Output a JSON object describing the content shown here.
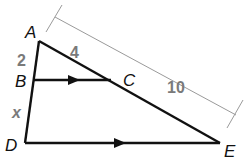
{
  "diagram": {
    "type": "geometry-triangle-parallel-lines",
    "points": {
      "A": {
        "label": "A"
      },
      "B": {
        "label": "B"
      },
      "C": {
        "label": "C"
      },
      "D": {
        "label": "D"
      },
      "E": {
        "label": "E"
      }
    },
    "measurements": {
      "AB": "2",
      "BD": "x",
      "AC": "4",
      "AE": "10"
    },
    "parallel_segments": [
      "BC",
      "DE"
    ],
    "colors": {
      "lines": "#111111",
      "measure_text": "#7a7a7a",
      "dimension_line": "#9a9a9a"
    }
  }
}
